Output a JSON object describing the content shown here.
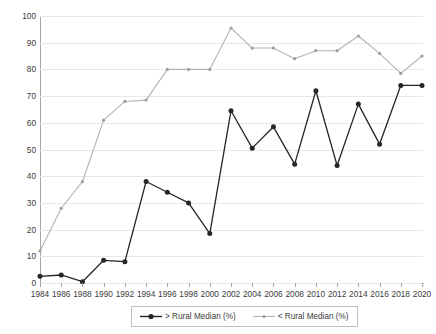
{
  "chart_data": {
    "type": "line",
    "title": "",
    "xlabel": "",
    "ylabel": "Republican Primary Voters (%)",
    "ylim": [
      0,
      100
    ],
    "ytick_step": 10,
    "grid": true,
    "legend_position": "bottom",
    "categories": [
      "1984",
      "1986",
      "1988",
      "1990",
      "1992",
      "1994",
      "1996",
      "1998",
      "2000",
      "2002",
      "2004",
      "2006",
      "2008",
      "2010",
      "2012",
      "2014",
      "2016",
      "2018",
      "2020"
    ],
    "series": [
      {
        "name": "> Rural Median (%)",
        "color": "#262626",
        "marker": "filled-circle",
        "values": [
          2.5,
          3,
          0.5,
          8.5,
          8,
          38,
          34,
          30,
          18.5,
          64.5,
          50.5,
          58.5,
          44.5,
          72,
          44,
          67,
          52,
          74,
          74
        ]
      },
      {
        "name": "< Rural Median (%)",
        "color": "#b3b3b3",
        "marker": "small-dot",
        "values": [
          12,
          28,
          38,
          61,
          68,
          68.5,
          80,
          80,
          80,
          95.5,
          88,
          88,
          84,
          87,
          87,
          92.5,
          86,
          78.5,
          85
        ]
      }
    ],
    "ytick_labels": [
      "0",
      "10",
      "20",
      "30",
      "40",
      "50",
      "60",
      "70",
      "80",
      "90",
      "100"
    ]
  },
  "legend": {
    "entries": [
      {
        "label": "> Rural Median (%)"
      },
      {
        "label": "< Rural Median (%)"
      }
    ]
  }
}
